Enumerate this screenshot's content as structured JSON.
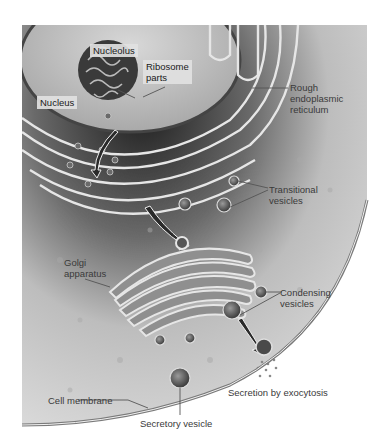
{
  "figure": {
    "type": "biological-illustration",
    "colors": {
      "background": "#ffffff",
      "cytoplasm": "#d9d9d9",
      "nucleus_dark": "#2b2b2b",
      "membrane": "#e8e8e8",
      "label_text": "#2a2a2a"
    }
  },
  "labels": {
    "nucleolus": "Nucleolus",
    "ribosome_parts": "Ribosome\nparts",
    "nucleus": "Nucleus",
    "rough_er": "Rough\nendoplasmic\nreticulum",
    "transitional_vesicles": "Transitional\nvesicles",
    "golgi": "Golgi\napparatus",
    "condensing_vesicles": "Condensing\nvesicles",
    "exocytosis": "Secretion by exocytosis",
    "cell_membrane": "Cell membrane",
    "secretory_vesicle": "Secretory vesicle"
  }
}
